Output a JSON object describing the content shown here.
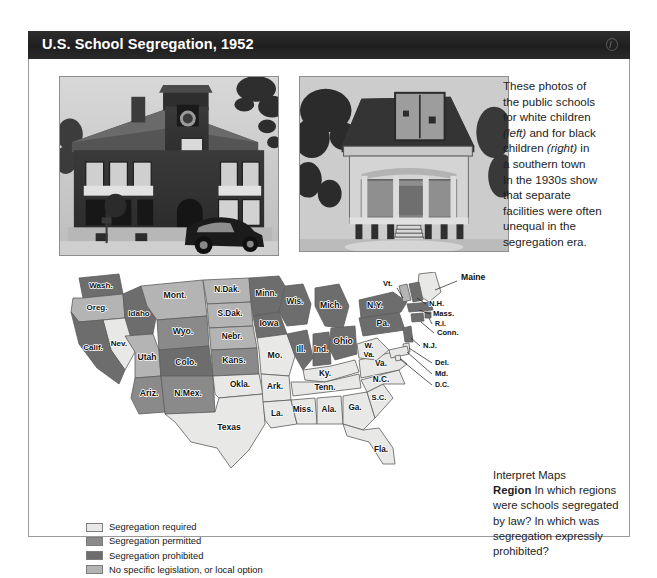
{
  "header": {
    "title": "U.S. School Segregation, 1952",
    "icon": "globe-icon"
  },
  "photos": [
    {
      "id": "photo-white",
      "alt": "Two-story brick public school for white children with parked 1930s automobile"
    },
    {
      "id": "photo-black",
      "alt": "Dilapidated wooden one-room school for black children raised on piers with open porch"
    }
  ],
  "caption": {
    "line1": "These photos of",
    "line2": "the public schools",
    "line3": "for white children",
    "line4_italic": "(left)",
    "line4_rest": " and for black",
    "line5": "children ",
    "line5_italic": "(right)",
    "line5_rest": " in",
    "line6": "a southern town",
    "line7": "In the 1930s show",
    "line8": "that separate",
    "line9": "facilities were often",
    "line10": "unequal in the",
    "line11": "segregation era."
  },
  "legend": {
    "items": [
      {
        "label": "Segregation required",
        "color": "#e8e8e6"
      },
      {
        "label": "Segregation permitted",
        "color": "#8a8a8a"
      },
      {
        "label": "Segregation prohibited",
        "color": "#6d6d6d"
      },
      {
        "label": "No specific legislation, or local option",
        "color": "#b4b4b4"
      }
    ]
  },
  "interpret": {
    "heading": "Interpret Maps",
    "term": "Region",
    "question": "In which regions were schools segregated by law? In which was segregation expressly prohibited?"
  },
  "chart_data": {
    "type": "map",
    "title": "U.S. School Segregation, 1952",
    "category_colors": {
      "required": "#e8e8e6",
      "permitted": "#8a8a8a",
      "prohibited": "#6d6d6d",
      "none": "#b4b4b4"
    },
    "states": [
      {
        "label": "Wash.",
        "category": "prohibited"
      },
      {
        "label": "Oreg.",
        "category": "none"
      },
      {
        "label": "Idaho",
        "category": "prohibited"
      },
      {
        "label": "Mont.",
        "category": "none"
      },
      {
        "label": "Nev.",
        "category": "required"
      },
      {
        "label": "Utah",
        "category": "none"
      },
      {
        "label": "Wyo.",
        "category": "permitted"
      },
      {
        "label": "Colo.",
        "category": "prohibited"
      },
      {
        "label": "Calif.",
        "category": "prohibited"
      },
      {
        "label": "Ariz.",
        "category": "permitted"
      },
      {
        "label": "N.Mex.",
        "category": "permitted"
      },
      {
        "label": "N.Dak.",
        "category": "none"
      },
      {
        "label": "S.Dak.",
        "category": "none"
      },
      {
        "label": "Nebr.",
        "category": "none"
      },
      {
        "label": "Kans.",
        "category": "permitted"
      },
      {
        "label": "Okla.",
        "category": "required"
      },
      {
        "label": "Texas",
        "category": "required"
      },
      {
        "label": "Minn.",
        "category": "prohibited"
      },
      {
        "label": "Iowa",
        "category": "prohibited"
      },
      {
        "label": "Mo.",
        "category": "required"
      },
      {
        "label": "Ark.",
        "category": "required"
      },
      {
        "label": "La.",
        "category": "required"
      },
      {
        "label": "Wis.",
        "category": "prohibited"
      },
      {
        "label": "Ill.",
        "category": "prohibited"
      },
      {
        "label": "Mich.",
        "category": "prohibited"
      },
      {
        "label": "Ind.",
        "category": "prohibited"
      },
      {
        "label": "Ohio",
        "category": "prohibited"
      },
      {
        "label": "Ky.",
        "category": "required"
      },
      {
        "label": "Tenn.",
        "category": "required"
      },
      {
        "label": "Miss.",
        "category": "required"
      },
      {
        "label": "Ala.",
        "category": "required"
      },
      {
        "label": "Ga.",
        "category": "required"
      },
      {
        "label": "Fla.",
        "category": "required"
      },
      {
        "label": "S.C.",
        "category": "required"
      },
      {
        "label": "N.C.",
        "category": "required"
      },
      {
        "label": "Va.",
        "category": "required"
      },
      {
        "label": "W. Va.",
        "category": "required"
      },
      {
        "label": "Pa.",
        "category": "prohibited"
      },
      {
        "label": "N.Y.",
        "category": "prohibited"
      },
      {
        "label": "Vt.",
        "category": "none"
      },
      {
        "label": "Maine",
        "category": "required"
      },
      {
        "label": "N.H.",
        "category": "prohibited"
      },
      {
        "label": "Mass.",
        "category": "prohibited"
      },
      {
        "label": "R.I.",
        "category": "prohibited"
      },
      {
        "label": "Conn.",
        "category": "prohibited"
      },
      {
        "label": "N.J.",
        "category": "prohibited"
      },
      {
        "label": "Del.",
        "category": "required"
      },
      {
        "label": "Md.",
        "category": "required"
      },
      {
        "label": "D.C.",
        "category": "required"
      }
    ]
  }
}
